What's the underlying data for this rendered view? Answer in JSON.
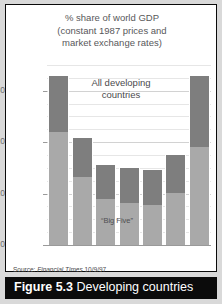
{
  "figure": {
    "caption_number": "Figure 5.3",
    "caption_text": "Developing countries"
  },
  "source": {
    "prefix": "Source:",
    "publication": "Financial Times",
    "date": "10/9/97"
  },
  "annotations": {
    "all_developing": "All developing\ncountries",
    "all_developing_line1": "All developing",
    "all_developing_line2": "countries",
    "big_five": "“Big Five”"
  },
  "colors": {
    "all_developing_segment": "#7e7e7e",
    "big_five_segment": "#a9a9a9",
    "caption_background": "#0b0b0b",
    "caption_text": "#ffffff",
    "gridline": "#d2d2d2",
    "page_background": "#d9d9d9"
  },
  "chart_data": {
    "type": "bar",
    "title": "% share of world GDP\n(constant 1987 prices and\nmarket exchange rates)",
    "title_line1": "% share of world GDP",
    "title_line2": "(constant 1987 prices and",
    "title_line3": "market exchange rates)",
    "xlabel": "",
    "ylabel": "",
    "ylim": [
      0,
      35
    ],
    "yticks": [
      0,
      10,
      20,
      30
    ],
    "ytick_labels": [
      "0",
      "10",
      "20",
      "30"
    ],
    "grid": true,
    "legend": "none",
    "stacked": true,
    "categories": [
      "1820",
      "70",
      "1913",
      "50",
      "73",
      "95",
      "2020"
    ],
    "category_sublabels": [
      "",
      "",
      "",
      "",
      "",
      "",
      "est"
    ],
    "series": [
      {
        "name": "“Big Five”",
        "values": [
          22.0,
          13.2,
          9.0,
          8.1,
          7.7,
          10.1,
          19.0
        ]
      },
      {
        "name": "All developing countries",
        "values": [
          32.8,
          20.9,
          15.6,
          15.0,
          14.6,
          17.5,
          32.8
        ]
      }
    ],
    "totals": [
      32.8,
      20.9,
      15.6,
      15.0,
      14.6,
      17.5,
      32.8
    ]
  }
}
